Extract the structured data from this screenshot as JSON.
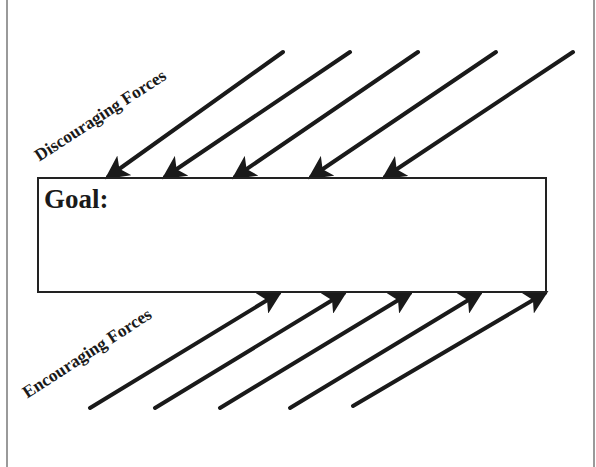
{
  "diagram": {
    "type": "force-field-analysis",
    "goal": {
      "label": "Goal:"
    },
    "discouraging": {
      "label": "Discouraging Forces",
      "arrows": [
        {
          "x1": 283,
          "y1": 52,
          "x2": 108,
          "y2": 177
        },
        {
          "x1": 350,
          "y1": 52,
          "x2": 165,
          "y2": 177
        },
        {
          "x1": 418,
          "y1": 52,
          "x2": 235,
          "y2": 177
        },
        {
          "x1": 496,
          "y1": 52,
          "x2": 311,
          "y2": 177
        },
        {
          "x1": 573,
          "y1": 52,
          "x2": 385,
          "y2": 177
        }
      ]
    },
    "encouraging": {
      "label": "Encouraging Forces",
      "arrows": [
        {
          "x1": 90,
          "y1": 408,
          "x2": 279,
          "y2": 293
        },
        {
          "x1": 155,
          "y1": 408,
          "x2": 344,
          "y2": 293
        },
        {
          "x1": 220,
          "y1": 408,
          "x2": 410,
          "y2": 293
        },
        {
          "x1": 290,
          "y1": 408,
          "x2": 480,
          "y2": 293
        },
        {
          "x1": 353,
          "y1": 406,
          "x2": 545,
          "y2": 293
        }
      ]
    },
    "colors": {
      "ink": "#1a1a1a",
      "frame": "#9a9a9a",
      "background": "#ffffff"
    }
  }
}
